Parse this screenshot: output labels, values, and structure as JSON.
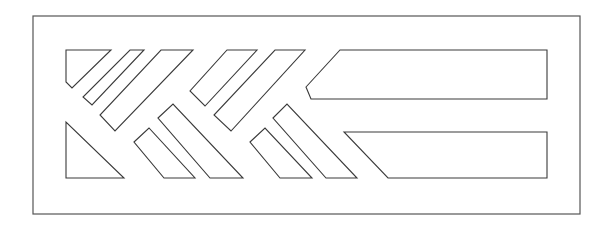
{
  "drawing": {
    "type": "vent-grille-cutout-pattern",
    "stroke_color": "#3a3a3a",
    "frame_color": "#555555",
    "background": "#ffffff",
    "frame": {
      "x": 33,
      "y": 16,
      "width": 547,
      "height": 198
    },
    "top_row": [
      {
        "name": "corner-pentagon",
        "points": "66,50 111,50 72,88 66,82"
      },
      {
        "name": "slat-thin",
        "points": "130,50 144,50 92,105 83,97"
      },
      {
        "name": "slat-long-1",
        "points": "161,50 193,50 115,131 100,115"
      },
      {
        "name": "slat-mid",
        "points": "227,50 257,50 205,106 190,91"
      },
      {
        "name": "slat-long-2",
        "points": "275,50 305,50 231,131 214,115"
      },
      {
        "name": "long-panel-top",
        "points": "340,50 547,50 547,99 311,99 306,87"
      }
    ],
    "bottom_row": [
      {
        "name": "corner-triangle",
        "points": "66,122 66,178 124,178"
      },
      {
        "name": "slat-short-1",
        "points": "134,142 149,128 195,178 164,178"
      },
      {
        "name": "slat-long-3",
        "points": "158,118 173,104 243,178 210,178"
      },
      {
        "name": "slat-short-2",
        "points": "250,142 265,128 312,178 280,178"
      },
      {
        "name": "slat-long-4",
        "points": "273,118 287,104 357,178 326,178"
      },
      {
        "name": "long-panel-bottom",
        "points": "344,132 547,132 547,178 388,178"
      }
    ]
  }
}
